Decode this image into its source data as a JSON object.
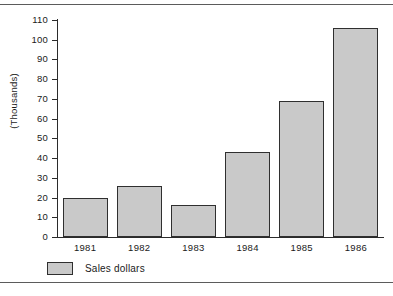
{
  "chart_data": {
    "type": "bar",
    "title": "",
    "xlabel": "",
    "ylabel": "(Thousands)",
    "categories": [
      "1981",
      "1982",
      "1983",
      "1984",
      "1985",
      "1986"
    ],
    "values": [
      20,
      26,
      16,
      43,
      69,
      106
    ],
    "series": [
      {
        "name": "Sales dollars",
        "values": [
          20,
          26,
          16,
          43,
          69,
          106
        ]
      }
    ],
    "ylim": [
      0,
      110
    ],
    "ytick_step": 10,
    "ytick_labels": [
      "110",
      "100",
      "90",
      "80",
      "70",
      "60",
      "50",
      "40",
      "30",
      "20",
      "10",
      "0"
    ],
    "grid": false,
    "legend": {
      "position": "bottom-left",
      "entries": [
        {
          "label": "Sales dollars",
          "color": "#c9c9c9"
        }
      ]
    },
    "colors": {
      "bar_fill": "#c9c9c9",
      "bar_border": "#2f2f2f",
      "axis": "#2b2b2b",
      "text": "#1a1a1a",
      "background": "#ffffff",
      "rule": "#5b5b5b"
    }
  }
}
